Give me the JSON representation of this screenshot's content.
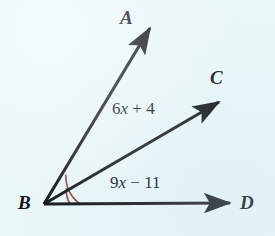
{
  "figure": {
    "kind": "geometry-angle-diagram",
    "background_color": "#eaf7f9",
    "stroke_color": "#111418",
    "arc_color": "#8b4a4a",
    "width": 275,
    "height": 236
  },
  "points": {
    "vertex": {
      "name": "B",
      "label": "B",
      "x": 44,
      "y": 204
    },
    "a": {
      "name": "A",
      "label": "A",
      "x": 152,
      "y": 25
    },
    "c": {
      "name": "C",
      "label": "C",
      "x": 222,
      "y": 100
    },
    "d": {
      "name": "D",
      "label": "D",
      "x": 233,
      "y": 203
    }
  },
  "rays": [
    {
      "name": "ray-BA",
      "from": "B",
      "to": "A",
      "x1": 44,
      "y1": 204,
      "x2": 152,
      "y2": 25
    },
    {
      "name": "ray-BC",
      "from": "B",
      "to": "C",
      "x1": 44,
      "y1": 204,
      "x2": 222,
      "y2": 100
    },
    {
      "name": "ray-BD",
      "from": "B",
      "to": "D",
      "x1": 44,
      "y1": 204,
      "x2": 233,
      "y2": 203
    }
  ],
  "arcs": [
    {
      "name": "arc-angle-ABD",
      "radius": 36,
      "from_ray": "ray-BA",
      "to_ray": "ray-BD"
    },
    {
      "name": "arc-angle-CBD",
      "radius": 26,
      "from_ray": "ray-BC",
      "to_ray": "ray-BD"
    }
  ],
  "labels": {
    "upper_expression": {
      "full": "6x + 4",
      "coefficient": "6",
      "variable": "x",
      "operator": "+",
      "constant": "4",
      "describes": "angle ABC"
    },
    "lower_expression": {
      "full": "9x − 11",
      "coefficient": "9",
      "variable": "x",
      "operator": "−",
      "constant": "11",
      "describes": "angle CBD"
    }
  }
}
